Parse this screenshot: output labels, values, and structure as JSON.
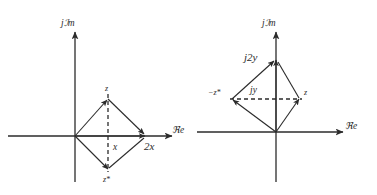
{
  "page": {
    "background_color": "#ffffff",
    "line_color": "#2b2b2b",
    "width": 377,
    "height": 195
  },
  "figures": [
    {
      "id": "left",
      "name": "z-plus-z-conjugate",
      "caption": "z + z* = 2x",
      "axes": {
        "imaginary_label": "jℐm",
        "real_label": "ℜe"
      },
      "labels": {
        "vertex_top": "z",
        "vertex_bottom": "z*",
        "midpoint": "x",
        "resultant": "2x"
      }
    },
    {
      "id": "right",
      "name": "z-minus-z-conjugate",
      "caption": "z − z* = j2y",
      "axes": {
        "imaginary_label": "jℐm",
        "real_label": "ℜe"
      },
      "labels": {
        "vertex_right": "z",
        "vertex_left": "−z*",
        "midpoint": "jy",
        "resultant": "j2y"
      }
    }
  ]
}
